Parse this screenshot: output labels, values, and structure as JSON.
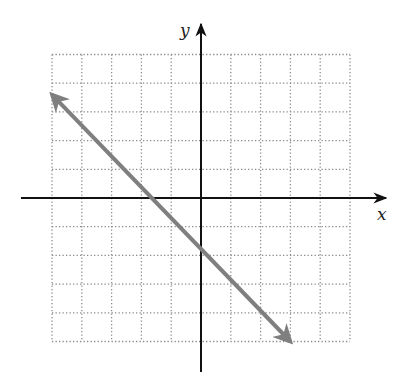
{
  "chart_data": {
    "type": "line",
    "title": "",
    "xlabel": "x",
    "ylabel": "y",
    "xlim": [
      -5,
      5
    ],
    "ylim": [
      -5,
      5
    ],
    "grid": true,
    "grid_style": "dotted",
    "tick_labels": false,
    "series": [
      {
        "name": "line",
        "color": "#7f7f7f",
        "both_ends_arrows": true,
        "x": [
          -5,
          3
        ],
        "y": [
          3.6,
          -5
        ],
        "slope": -1.07,
        "y_intercept": -1.8,
        "x_intercept": -1.7
      }
    ]
  },
  "labels": {
    "x_axis": "x",
    "y_axis": "y"
  },
  "colors": {
    "axis": "#111111",
    "grid": "#8a8a8a",
    "line": "#7f7f7f"
  }
}
